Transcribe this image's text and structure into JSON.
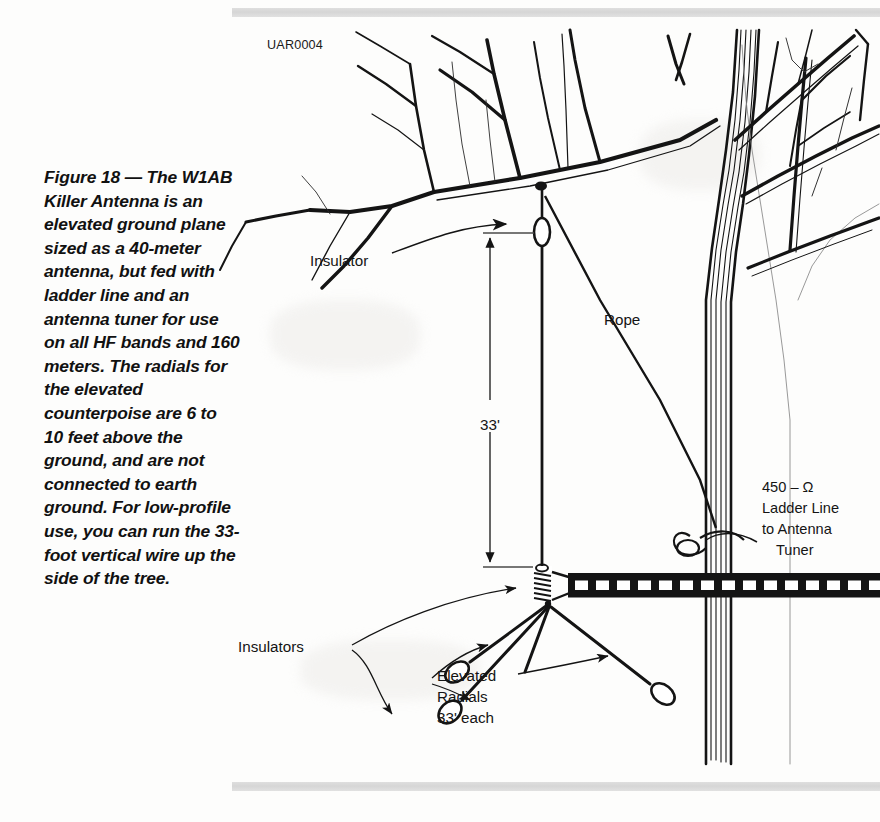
{
  "figure": {
    "id_code": "UAR0004",
    "caption": "Figure 18 — The W1AB Killer Antenna is an elevated ground plane sized as a 40-meter antenna, but fed with ladder line and an antenna tuner for use on all HF bands and 160 meters. The radials for the elevated counterpoise are 6 to 10 feet above the ground, and are not connected to earth ground. For low-profile use, you can run the 33-foot vertical wire up the side of the tree."
  },
  "labels": {
    "insulator_top": "Insulator",
    "insulators_bottom": "Insulators",
    "rope": "Rope",
    "vertical_length": "33'",
    "feedline_line1": "450 – Ω",
    "feedline_line2": "Ladder Line",
    "feedline_line3": "to Antenna",
    "feedline_line4": "Tuner",
    "radials_line1": "Elevated",
    "radials_line2": "Radials",
    "radials_line3": "33' each"
  },
  "colors": {
    "ink": "#141414",
    "paper": "#fdfdfc",
    "scanbar": "#d4d4d4",
    "thin_line": "#3a3a3a"
  },
  "diagram_elements": {
    "tree": "bare-deciduous-tree-line-art",
    "vertical_wire": "33-foot vertical radiator",
    "radial_count": 4,
    "feedpoint": "coil-insulator",
    "transmission_line": "450-ohm open-wire ladder line"
  }
}
